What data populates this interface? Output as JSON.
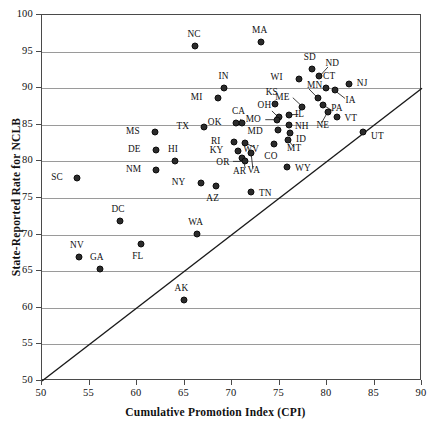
{
  "chart_data": {
    "type": "scatter",
    "title": "",
    "xlabel": "Cumulative Promotion Index (CPI)",
    "ylabel": "State-Reported Rate for NCLB",
    "xlim": [
      50,
      90
    ],
    "ylim": [
      50,
      100
    ],
    "xticks": [
      50,
      55,
      60,
      65,
      70,
      75,
      80,
      85,
      90
    ],
    "yticks": [
      50,
      55,
      60,
      65,
      70,
      75,
      80,
      85,
      90,
      95,
      100
    ],
    "grid": "horizontal",
    "legend": "none",
    "reference_line": {
      "label": "identity line y = x",
      "from": [
        50,
        50
      ],
      "to": [
        90,
        90
      ]
    },
    "point_color": "#2b2b2b",
    "axis_color": "#4a4a4a",
    "grid_color": "#9a9a9a",
    "points": [
      {
        "label": "NC",
        "x": 66.1,
        "y": 95.8,
        "lx": -1,
        "ly": -12
      },
      {
        "label": "MA",
        "x": 73.0,
        "y": 96.3,
        "lx": -1,
        "ly": -12
      },
      {
        "label": "SD",
        "x": 78.4,
        "y": 92.6,
        "lx": -2,
        "ly": -12
      },
      {
        "label": "ND",
        "x": 79.2,
        "y": 91.6,
        "lx": 8,
        "ly": -13
      },
      {
        "label": "CT",
        "x": 79.9,
        "y": 90.0,
        "lx": 3,
        "ly": -12
      },
      {
        "label": "NJ",
        "x": 82.3,
        "y": 90.6,
        "lx": 10,
        "ly": -1
      },
      {
        "label": "WI",
        "x": 77.0,
        "y": 91.2,
        "lx": -18,
        "ly": -2
      },
      {
        "label": "IA",
        "x": 80.8,
        "y": 89.7,
        "lx": 13,
        "ly": 10
      },
      {
        "label": "MN",
        "x": 79.0,
        "y": 88.7,
        "lx": -3,
        "ly": -13
      },
      {
        "label": "IN",
        "x": 69.2,
        "y": 90.0,
        "lx": -1,
        "ly": -12
      },
      {
        "label": "PA",
        "x": 79.6,
        "y": 87.7,
        "lx": 10,
        "ly": 3
      },
      {
        "label": "ME",
        "x": 77.4,
        "y": 87.5,
        "lx": -15,
        "ly": -10
      },
      {
        "label": "MI",
        "x": 68.5,
        "y": 88.7,
        "lx": -17,
        "ly": -1
      },
      {
        "label": "KS",
        "x": 74.5,
        "y": 87.8,
        "lx": -3,
        "ly": -12
      },
      {
        "label": "NE",
        "x": 80.1,
        "y": 86.8,
        "lx": -5,
        "ly": 13
      },
      {
        "label": "VT",
        "x": 81.0,
        "y": 86.0,
        "lx": 10,
        "ly": 1
      },
      {
        "label": "IL",
        "x": 76.0,
        "y": 86.4,
        "lx": 8,
        "ly": -1
      },
      {
        "label": "OH",
        "x": 74.9,
        "y": 86.0,
        "lx": -9,
        "ly": -12
      },
      {
        "label": "CA",
        "x": 71.0,
        "y": 85.3,
        "lx": -3,
        "ly": -12
      },
      {
        "label": "MO",
        "x": 74.7,
        "y": 85.7,
        "lx": -18,
        "ly": -1
      },
      {
        "label": "NH",
        "x": 76.0,
        "y": 85.0,
        "lx": 8,
        "ly": 1
      },
      {
        "label": "OK",
        "x": 70.4,
        "y": 85.2,
        "lx": -16,
        "ly": -1
      },
      {
        "label": "TX",
        "x": 67.1,
        "y": 84.7,
        "lx": -17,
        "ly": -1
      },
      {
        "label": "MD",
        "x": 74.8,
        "y": 84.3,
        "lx": -17,
        "ly": 1
      },
      {
        "label": "ID",
        "x": 76.1,
        "y": 83.9,
        "lx": 8,
        "ly": 6
      },
      {
        "label": "MS",
        "x": 61.9,
        "y": 84.0,
        "lx": -17,
        "ly": -1
      },
      {
        "label": "UT",
        "x": 83.8,
        "y": 84.0,
        "lx": 10,
        "ly": 4
      },
      {
        "label": "RI",
        "x": 70.2,
        "y": 82.7,
        "lx": -15,
        "ly": -1
      },
      {
        "label": "WV",
        "x": 71.4,
        "y": 82.5,
        "lx": 6,
        "ly": 6
      },
      {
        "label": "MT",
        "x": 75.9,
        "y": 82.9,
        "lx": 6,
        "ly": 8
      },
      {
        "label": "CO",
        "x": 74.4,
        "y": 82.4,
        "lx": -3,
        "ly": 12
      },
      {
        "label": "DE",
        "x": 62.0,
        "y": 81.5,
        "lx": -17,
        "ly": -1
      },
      {
        "label": "KY",
        "x": 70.6,
        "y": 81.4,
        "lx": -16,
        "ly": -1
      },
      {
        "label": "HI",
        "x": 64.0,
        "y": 80.0,
        "lx": -2,
        "ly": -12
      },
      {
        "label": "AR",
        "x": 71.1,
        "y": 80.5,
        "lx": -3,
        "ly": 13
      },
      {
        "label": "VA",
        "x": 72.0,
        "y": 81.2,
        "lx": 3,
        "ly": 17
      },
      {
        "label": "OR",
        "x": 71.4,
        "y": 80.0,
        "lx": -18,
        "ly": 1
      },
      {
        "label": "NM",
        "x": 62.0,
        "y": 78.8,
        "lx": -17,
        "ly": -1
      },
      {
        "label": "WY",
        "x": 75.8,
        "y": 79.2,
        "lx": 10,
        "ly": 1
      },
      {
        "label": "SC",
        "x": 53.7,
        "y": 77.8,
        "lx": -16,
        "ly": -1
      },
      {
        "label": "NY",
        "x": 66.7,
        "y": 77.0,
        "lx": -17,
        "ly": -1
      },
      {
        "label": "AZ",
        "x": 68.3,
        "y": 76.7,
        "lx": -3,
        "ly": 12
      },
      {
        "label": "TN",
        "x": 72.0,
        "y": 75.8,
        "lx": 10,
        "ly": 1
      },
      {
        "label": "DC",
        "x": 58.2,
        "y": 71.8,
        "lx": -2,
        "ly": -12
      },
      {
        "label": "WA",
        "x": 66.3,
        "y": 70.1,
        "lx": -1,
        "ly": -12
      },
      {
        "label": "FL",
        "x": 60.4,
        "y": 68.7,
        "lx": -3,
        "ly": 12
      },
      {
        "label": "NV",
        "x": 53.9,
        "y": 67.0,
        "lx": -2,
        "ly": -12
      },
      {
        "label": "GA",
        "x": 56.1,
        "y": 65.3,
        "lx": -3,
        "ly": -12
      },
      {
        "label": "AK",
        "x": 64.9,
        "y": 61.1,
        "lx": -2,
        "ly": -12
      }
    ],
    "leaders": [
      {
        "from_label": "ND",
        "tx": 79.2,
        "ty": 91.6,
        "ax": 80.1,
        "ay": 92.9
      },
      {
        "from_label": "IA",
        "tx": 80.8,
        "ty": 89.7,
        "ax": 81.9,
        "ay": 88.6
      },
      {
        "from_label": "MN",
        "tx": 79.0,
        "ty": 88.7,
        "ax": 78.1,
        "ay": 89.9
      },
      {
        "from_label": "PA",
        "tx": 79.6,
        "ty": 87.7,
        "ax": 80.6,
        "ay": 86.9
      },
      {
        "from_label": "ME",
        "tx": 77.4,
        "ty": 87.5,
        "ax": 76.4,
        "ay": 88.7
      },
      {
        "from_label": "NE",
        "tx": 80.1,
        "ty": 86.8,
        "ax": 79.4,
        "ay": 85.2
      },
      {
        "from_label": "IL",
        "tx": 76.0,
        "ty": 86.4,
        "ax": 77.0,
        "ay": 86.4
      },
      {
        "from_label": "OH",
        "tx": 74.9,
        "ty": 86.0,
        "ax": 74.2,
        "ay": 86.9
      },
      {
        "from_label": "MO",
        "tx": 74.7,
        "ty": 85.7,
        "ax": 73.5,
        "ay": 85.7
      },
      {
        "from_label": "WV",
        "tx": 71.4,
        "ty": 82.5,
        "ax": 72.4,
        "ay": 81.9
      },
      {
        "from_label": "MT",
        "tx": 75.9,
        "ty": 82.9,
        "ax": 76.5,
        "ay": 82.0
      },
      {
        "from_label": "AR",
        "tx": 71.1,
        "ty": 80.5,
        "ax": 71.4,
        "ay": 79.1
      },
      {
        "from_label": "VA",
        "tx": 72.0,
        "ty": 81.2,
        "ax": 72.2,
        "ay": 79.0
      },
      {
        "from_label": "OR",
        "tx": 71.4,
        "ty": 80.0,
        "ax": 70.1,
        "ay": 80.0
      },
      {
        "from_label": "CA",
        "tx": 71.0,
        "ty": 85.3,
        "ax": 70.9,
        "ay": 85.8
      }
    ]
  },
  "axes": {
    "x_title": "Cumulative Promotion Index (CPI)",
    "y_title": "State-Reported Rate for NCLB",
    "x_tick_labels": [
      "50",
      "55",
      "60",
      "65",
      "70",
      "75",
      "80",
      "85",
      "90"
    ],
    "y_tick_labels": [
      "50",
      "55",
      "60",
      "65",
      "70",
      "75",
      "80",
      "85",
      "90",
      "95",
      "100"
    ]
  }
}
